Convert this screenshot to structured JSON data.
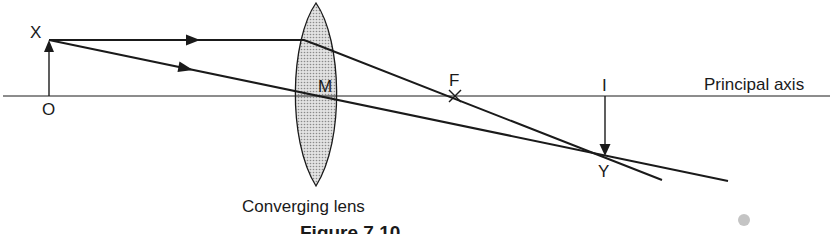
{
  "figure": {
    "caption": "Figure 7.10",
    "labels": {
      "object_top": "X",
      "object_base": "O",
      "optical_centre": "M",
      "focal_point": "F",
      "image_base": "I",
      "image_top": "Y",
      "axis": "Principal axis",
      "lens": "Converging lens"
    },
    "colors": {
      "line": "#1a1a1a",
      "lens_fill": "#cfcfcf",
      "background": "#ffffff"
    }
  }
}
